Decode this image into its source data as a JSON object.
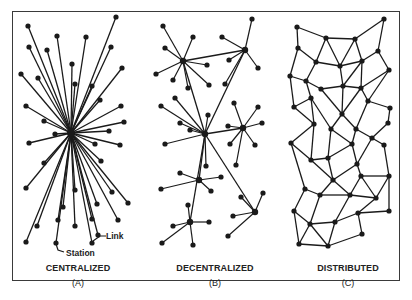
{
  "panels": [
    {
      "id": "A",
      "title": "CENTRALIZED",
      "letter": "(A)",
      "cx": 78
    },
    {
      "id": "B",
      "title": "DECENTRALIZED",
      "letter": "(B)",
      "cx": 215
    },
    {
      "id": "C",
      "title": "DISTRIBUTED",
      "letter": "(C)",
      "cx": 348
    }
  ],
  "annotations": {
    "link": "Link",
    "station": "Station"
  },
  "colors": {
    "ink": "#1a1a1a",
    "frame": "#3a3a3a",
    "background": "#ffffff"
  },
  "centralized": {
    "hub": [
      71,
      133
    ],
    "nodes": [
      [
        28,
        26
      ],
      [
        116,
        17
      ],
      [
        57,
        36
      ],
      [
        86,
        37
      ],
      [
        29,
        47
      ],
      [
        47,
        50
      ],
      [
        111,
        47
      ],
      [
        72,
        64
      ],
      [
        122,
        68
      ],
      [
        21,
        74
      ],
      [
        38,
        78
      ],
      [
        75,
        84
      ],
      [
        92,
        86
      ],
      [
        100,
        100
      ],
      [
        26,
        106
      ],
      [
        121,
        106
      ],
      [
        44,
        121
      ],
      [
        124,
        122
      ],
      [
        55,
        134
      ],
      [
        109,
        131
      ],
      [
        120,
        145
      ],
      [
        29,
        143
      ],
      [
        95,
        144
      ],
      [
        44,
        163
      ],
      [
        101,
        161
      ],
      [
        26,
        188
      ],
      [
        75,
        190
      ],
      [
        112,
        192
      ],
      [
        63,
        207
      ],
      [
        97,
        204
      ],
      [
        128,
        203
      ],
      [
        58,
        220
      ],
      [
        92,
        219
      ],
      [
        118,
        220
      ],
      [
        37,
        226
      ],
      [
        75,
        226
      ],
      [
        98,
        235
      ],
      [
        26,
        242
      ],
      [
        92,
        243
      ],
      [
        56,
        243
      ]
    ]
  },
  "decentralized": {
    "hubs": [
      [
        183,
        61
      ],
      [
        245,
        50
      ],
      [
        205,
        134
      ],
      [
        243,
        128
      ],
      [
        199,
        180
      ],
      [
        255,
        212
      ],
      [
        190,
        222
      ]
    ],
    "hub_links": [
      [
        0,
        1
      ],
      [
        0,
        2
      ],
      [
        1,
        2
      ],
      [
        2,
        3
      ],
      [
        2,
        4
      ],
      [
        2,
        6
      ],
      [
        2,
        5
      ]
    ],
    "leaves": [
      [
        0,
        [
          163,
          26
        ]
      ],
      [
        0,
        [
          193,
          37
        ]
      ],
      [
        0,
        [
          165,
          48
        ]
      ],
      [
        0,
        [
          156,
          74
        ]
      ],
      [
        0,
        [
          173,
          80
        ]
      ],
      [
        0,
        [
          188,
          88
        ]
      ],
      [
        0,
        [
          207,
          65
        ]
      ],
      [
        0,
        [
          209,
          85
        ]
      ],
      [
        1,
        [
          252,
          19
        ]
      ],
      [
        1,
        [
          222,
          37
        ]
      ],
      [
        1,
        [
          229,
          60
        ]
      ],
      [
        1,
        [
          258,
          68
        ]
      ],
      [
        1,
        [
          225,
          84
        ]
      ],
      [
        2,
        [
          175,
          98
        ]
      ],
      [
        2,
        [
          161,
          106
        ]
      ],
      [
        2,
        [
          180,
          123
        ]
      ],
      [
        2,
        [
          190,
          130
        ]
      ],
      [
        2,
        [
          208,
          115
        ]
      ],
      [
        2,
        [
          165,
          144
        ]
      ],
      [
        2,
        [
          206,
          166
        ]
      ],
      [
        3,
        [
          234,
          103
        ]
      ],
      [
        3,
        [
          258,
          107
        ]
      ],
      [
        3,
        [
          262,
          123
        ]
      ],
      [
        3,
        [
          228,
          126
        ]
      ],
      [
        3,
        [
          230,
          144
        ]
      ],
      [
        3,
        [
          255,
          145
        ]
      ],
      [
        3,
        [
          236,
          165
        ]
      ],
      [
        4,
        [
          180,
          173
        ]
      ],
      [
        4,
        [
          221,
          177
        ]
      ],
      [
        4,
        [
          161,
          189
        ]
      ],
      [
        4,
        [
          211,
          191
        ]
      ],
      [
        5,
        [
          241,
          197
        ]
      ],
      [
        5,
        [
          263,
          193
        ]
      ],
      [
        5,
        [
          233,
          216
        ]
      ],
      [
        5,
        [
          228,
          236
        ]
      ],
      [
        6,
        [
          188,
          205
        ]
      ],
      [
        6,
        [
          173,
          226
        ]
      ],
      [
        6,
        [
          209,
          222
        ]
      ],
      [
        6,
        [
          162,
          243
        ]
      ],
      [
        6,
        [
          193,
          245
        ]
      ]
    ]
  },
  "distributed": {
    "nodes": [
      [
        297,
        27
      ],
      [
        384,
        19
      ],
      [
        326,
        38
      ],
      [
        355,
        39
      ],
      [
        298,
        48
      ],
      [
        378,
        51
      ],
      [
        316,
        62
      ],
      [
        340,
        66
      ],
      [
        362,
        61
      ],
      [
        389,
        70
      ],
      [
        290,
        76
      ],
      [
        306,
        81
      ],
      [
        321,
        89
      ],
      [
        343,
        86
      ],
      [
        361,
        88
      ],
      [
        311,
        98
      ],
      [
        368,
        101
      ],
      [
        294,
        107
      ],
      [
        390,
        108
      ],
      [
        342,
        114
      ],
      [
        388,
        123
      ],
      [
        314,
        124
      ],
      [
        331,
        129
      ],
      [
        356,
        129
      ],
      [
        291,
        143
      ],
      [
        372,
        138
      ],
      [
        352,
        144
      ],
      [
        311,
        160
      ],
      [
        384,
        145
      ],
      [
        328,
        158
      ],
      [
        357,
        164
      ],
      [
        333,
        180
      ],
      [
        361,
        176
      ],
      [
        389,
        176
      ],
      [
        305,
        189
      ],
      [
        320,
        195
      ],
      [
        350,
        195
      ],
      [
        376,
        198
      ],
      [
        294,
        211
      ],
      [
        310,
        224
      ],
      [
        335,
        222
      ],
      [
        358,
        213
      ],
      [
        389,
        211
      ],
      [
        299,
        244
      ],
      [
        328,
        246
      ],
      [
        362,
        234
      ]
    ],
    "edges": [
      [
        0,
        2
      ],
      [
        2,
        3
      ],
      [
        3,
        1
      ],
      [
        1,
        5
      ],
      [
        0,
        4
      ],
      [
        2,
        6
      ],
      [
        2,
        7
      ],
      [
        3,
        7
      ],
      [
        3,
        8
      ],
      [
        5,
        8
      ],
      [
        5,
        9
      ],
      [
        4,
        6
      ],
      [
        4,
        10
      ],
      [
        6,
        7
      ],
      [
        7,
        8
      ],
      [
        6,
        11
      ],
      [
        8,
        13
      ],
      [
        7,
        13
      ],
      [
        8,
        14
      ],
      [
        9,
        14
      ],
      [
        9,
        16
      ],
      [
        10,
        11
      ],
      [
        11,
        12
      ],
      [
        12,
        13
      ],
      [
        13,
        14
      ],
      [
        14,
        16
      ],
      [
        10,
        17
      ],
      [
        11,
        15
      ],
      [
        12,
        19
      ],
      [
        13,
        19
      ],
      [
        14,
        19
      ],
      [
        15,
        17
      ],
      [
        15,
        22
      ],
      [
        16,
        18
      ],
      [
        16,
        23
      ],
      [
        18,
        20
      ],
      [
        19,
        23
      ],
      [
        17,
        21
      ],
      [
        15,
        21
      ],
      [
        19,
        22
      ],
      [
        20,
        25
      ],
      [
        23,
        26
      ],
      [
        23,
        25
      ],
      [
        21,
        24
      ],
      [
        21,
        27
      ],
      [
        22,
        29
      ],
      [
        22,
        26
      ],
      [
        24,
        27
      ],
      [
        26,
        29
      ],
      [
        26,
        30
      ],
      [
        25,
        28
      ],
      [
        28,
        33
      ],
      [
        25,
        30
      ],
      [
        27,
        29
      ],
      [
        27,
        31
      ],
      [
        29,
        31
      ],
      [
        30,
        32
      ],
      [
        30,
        31
      ],
      [
        32,
        33
      ],
      [
        31,
        35
      ],
      [
        31,
        36
      ],
      [
        32,
        36
      ],
      [
        32,
        37
      ],
      [
        33,
        37
      ],
      [
        24,
        34
      ],
      [
        34,
        35
      ],
      [
        35,
        36
      ],
      [
        36,
        37
      ],
      [
        34,
        38
      ],
      [
        35,
        39
      ],
      [
        36,
        40
      ],
      [
        37,
        41
      ],
      [
        41,
        42
      ],
      [
        33,
        42
      ],
      [
        38,
        39
      ],
      [
        39,
        40
      ],
      [
        40,
        41
      ],
      [
        38,
        43
      ],
      [
        39,
        43
      ],
      [
        43,
        44
      ],
      [
        39,
        44
      ],
      [
        40,
        44
      ],
      [
        44,
        45
      ],
      [
        41,
        45
      ]
    ]
  }
}
